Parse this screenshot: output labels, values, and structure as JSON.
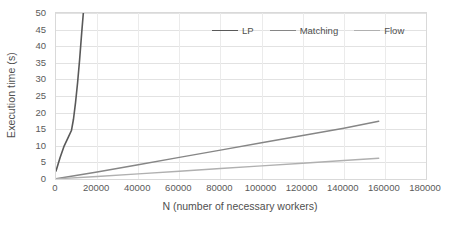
{
  "chart_data": {
    "type": "line",
    "title": "",
    "xlabel": "N (number of necessary workers)",
    "ylabel": "Execution time (s)",
    "xlim": [
      0,
      180000
    ],
    "ylim": [
      0,
      50
    ],
    "xticks": [
      0,
      20000,
      40000,
      60000,
      80000,
      100000,
      120000,
      140000,
      160000,
      180000
    ],
    "xtick_labels": [
      "0",
      "20000",
      "40000",
      "60000",
      "80000",
      "100000",
      "120000",
      "140000",
      "160000",
      "180000"
    ],
    "yticks": [
      0,
      5,
      10,
      15,
      20,
      25,
      30,
      35,
      40,
      45,
      50
    ],
    "ytick_labels": [
      "0",
      "5",
      "10",
      "15",
      "20",
      "25",
      "30",
      "35",
      "40",
      "45",
      "50"
    ],
    "grid": true,
    "legend_position": "top-center",
    "series": [
      {
        "name": "LP",
        "color": "#595959",
        "width": 1.6,
        "points": [
          [
            0,
            2.4
          ],
          [
            2000,
            6.5
          ],
          [
            4000,
            10.0
          ],
          [
            6000,
            12.6
          ],
          [
            7500,
            14.6
          ],
          [
            8500,
            18.0
          ],
          [
            9500,
            23.0
          ],
          [
            10500,
            29.0
          ],
          [
            11500,
            36.0
          ],
          [
            12500,
            44.0
          ],
          [
            13300,
            50.0
          ]
        ]
      },
      {
        "name": "Matching",
        "color": "#868686",
        "width": 1.4,
        "points": [
          [
            0,
            0.05
          ],
          [
            20000,
            2.1
          ],
          [
            40000,
            4.3
          ],
          [
            60000,
            6.5
          ],
          [
            80000,
            8.7
          ],
          [
            100000,
            10.9
          ],
          [
            120000,
            13.1
          ],
          [
            140000,
            15.3
          ],
          [
            157000,
            17.4
          ]
        ]
      },
      {
        "name": "Flow",
        "color": "#b0b0b0",
        "width": 1.4,
        "points": [
          [
            0,
            0.05
          ],
          [
            20000,
            0.75
          ],
          [
            40000,
            1.55
          ],
          [
            60000,
            2.35
          ],
          [
            80000,
            3.15
          ],
          [
            100000,
            3.95
          ],
          [
            120000,
            4.75
          ],
          [
            140000,
            5.55
          ],
          [
            157000,
            6.25
          ]
        ]
      }
    ]
  }
}
